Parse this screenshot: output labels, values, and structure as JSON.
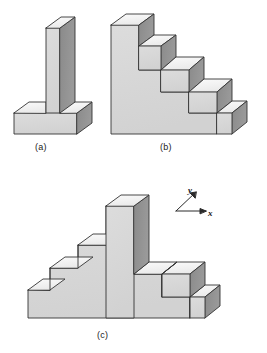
{
  "figure": {
    "kind": "isometric-solid-diagram",
    "background_color": "#ffffff",
    "panels": [
      {
        "label": "(a)",
        "name": "panel-a",
        "description": "T-shaped (inverted-T) isometric solid: tall thin vertical column standing on a wide flat rectangular base"
      },
      {
        "label": "(b)",
        "name": "panel-b",
        "description": "Isometric staircase solid descending left-to-right with five steps"
      },
      {
        "label": "(c)",
        "name": "panel-c",
        "description": "Isometric symmetric ziggurat / stepped pyramid solid with a tall central tower and two steps descending on each side"
      }
    ],
    "axis_indicator": {
      "name": "axis-triad",
      "x_label": "x",
      "y_label": "y",
      "x_direction": "right",
      "y_direction": "up-left-diagonal"
    },
    "colors": {
      "top_face": "#f2f2f2",
      "front_face": "#d7d7d7",
      "side_face": "#8f8f8f",
      "outline": "#333333",
      "text": "#1a1a1a"
    }
  }
}
